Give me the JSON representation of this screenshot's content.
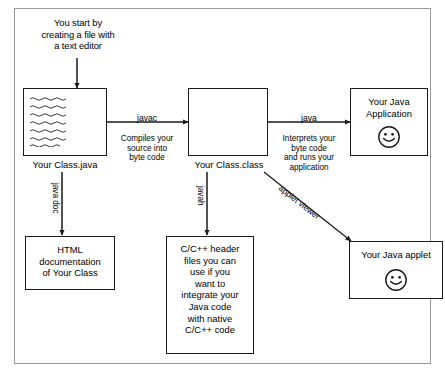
{
  "diagram": {
    "title_note": "You start by\ncreating a file with\na text editor",
    "boxes": {
      "source": {
        "label": "Your Class.java",
        "content": ""
      },
      "classfile": {
        "label": "Your Class.class",
        "content": ""
      },
      "application": {
        "content": "Your Java\nApplication"
      },
      "htmldoc": {
        "content": "HTML\ndocumentation\nof Your Class"
      },
      "headers": {
        "content": "C/C++ header\nfiles you can\nuse if you\nwant to\nintegrate your\nJava code\nwith native\nC/C++ code"
      },
      "applet": {
        "content": "Your Java applet"
      }
    },
    "arrows": {
      "javac": {
        "tool": "javac",
        "desc": "Compiles your\nsource into\nbyte code"
      },
      "java": {
        "tool": "java",
        "desc": "Interprets your\nbyte code\nand runs your\napplication"
      },
      "javadoc": {
        "tool": "java doc"
      },
      "javah": {
        "tool": "javah"
      },
      "appletviewer": {
        "tool": "applet viewer"
      }
    },
    "colors": {
      "ink": "#1a1a1a",
      "frame": "#9a9a9a",
      "background": "#ffffff"
    }
  }
}
